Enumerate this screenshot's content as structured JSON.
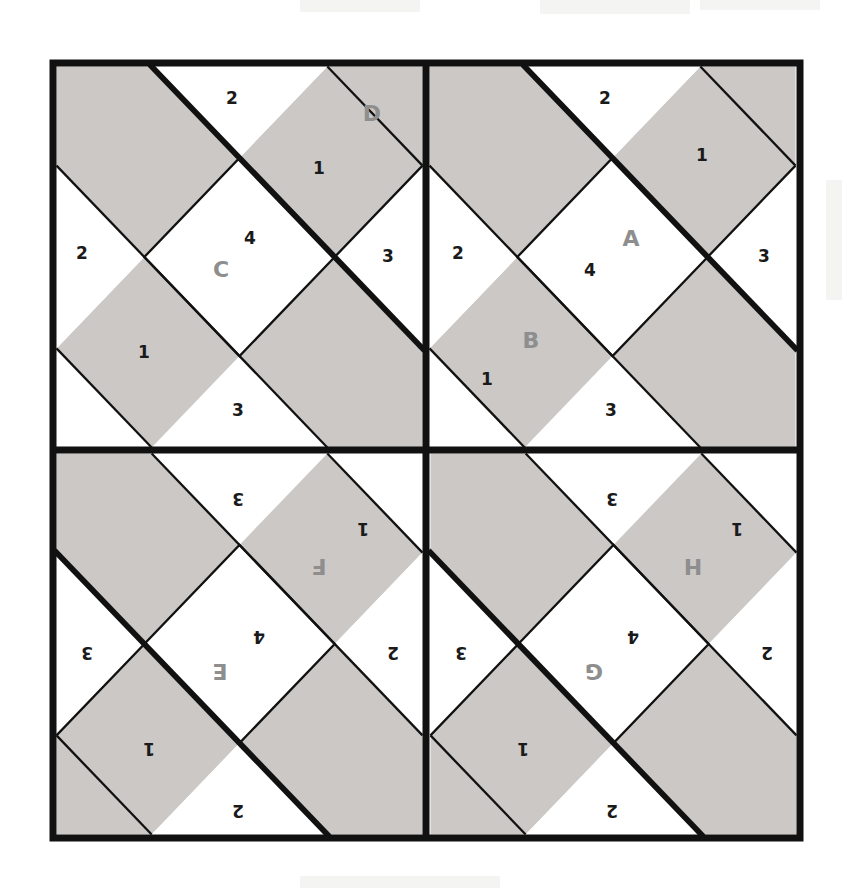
{
  "figure": {
    "colors": {
      "band_fill": "#cbc8c6",
      "white_fill": "#ffffff",
      "stroke": "#111111",
      "number_text": "#1a1a1a",
      "label_text": "#8e8e8e",
      "page_background": "#ffffff"
    },
    "geometry": {
      "outer_left": 53,
      "outer_top": 63,
      "outer_right": 800,
      "outer_bottom": 838,
      "center_x": 426,
      "center_y": 450,
      "outer_border_width": 7,
      "divider_width": 7,
      "thick_line_width": 6,
      "thin_line_width": 2.2
    },
    "quadrants": [
      {
        "id": "top-left",
        "labels": [
          "C",
          "D"
        ],
        "orientation": "upright",
        "numbers": [
          "2",
          "1",
          "2",
          "4",
          "3",
          "1",
          "3"
        ]
      },
      {
        "id": "top-right",
        "labels": [
          "A",
          "B"
        ],
        "orientation": "upright",
        "numbers": [
          "2",
          "1",
          "2",
          "4",
          "3",
          "1",
          "3"
        ]
      },
      {
        "id": "bottom-left",
        "labels": [
          "E",
          "F"
        ],
        "orientation": "rotated-180",
        "numbers": [
          "2",
          "1",
          "2",
          "4",
          "3",
          "1",
          "3"
        ]
      },
      {
        "id": "bottom-right",
        "labels": [
          "G",
          "H"
        ],
        "orientation": "rotated-180",
        "numbers": [
          "2",
          "1",
          "2",
          "4",
          "3",
          "1",
          "3"
        ]
      }
    ],
    "cells": {
      "top_left": {
        "n_top": "2",
        "n_upper_right": "1",
        "n_left": "2",
        "n_center": "4",
        "n_right": "3",
        "n_lower_left": "1",
        "n_bottom": "3",
        "label_main": "C",
        "label_secondary": "D"
      },
      "top_right": {
        "n_top": "2",
        "n_upper_right": "1",
        "n_left": "2",
        "n_center": "4",
        "n_right": "3",
        "n_lower_left": "1",
        "n_bottom": "3",
        "label_main": "A",
        "label_secondary": "B"
      },
      "bottom_left": {
        "n_top": "2",
        "n_upper_right": "1",
        "n_left": "2",
        "n_center": "4",
        "n_right": "3",
        "n_lower_left": "1",
        "n_bottom": "3",
        "label_main": "E",
        "label_secondary": "F"
      },
      "bottom_right": {
        "n_top": "2",
        "n_upper_right": "1",
        "n_left": "2",
        "n_center": "4",
        "n_right": "3",
        "n_lower_left": "1",
        "n_bottom": "3",
        "label_main": "G",
        "label_secondary": "H"
      }
    }
  }
}
